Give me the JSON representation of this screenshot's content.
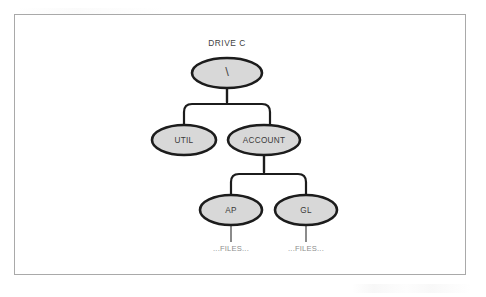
{
  "diagram": {
    "type": "tree",
    "title": "DRIVE C",
    "root": {
      "id": "root",
      "label": "\\",
      "cx": 227,
      "cy": 73,
      "rx": 35,
      "ry": 15
    },
    "nodes": [
      {
        "id": "util",
        "label": "UTIL",
        "cx": 184,
        "cy": 140,
        "rx": 32,
        "ry": 15
      },
      {
        "id": "account",
        "label": "ACCOUNT",
        "cx": 264,
        "cy": 140,
        "rx": 36,
        "ry": 15
      },
      {
        "id": "ap",
        "label": "AP",
        "cx": 231,
        "cy": 210,
        "rx": 31,
        "ry": 15
      },
      {
        "id": "gl",
        "label": "GL",
        "cx": 306,
        "cy": 210,
        "rx": 31,
        "ry": 15
      }
    ],
    "leaves": [
      {
        "id": "ap-files",
        "label": "...FILES...",
        "x": 231,
        "y": 249
      },
      {
        "id": "gl-files",
        "label": "...FILES...",
        "x": 306,
        "y": 249
      }
    ],
    "edges": [
      {
        "from": "root",
        "to": "util"
      },
      {
        "from": "root",
        "to": "account"
      },
      {
        "from": "account",
        "to": "ap"
      },
      {
        "from": "account",
        "to": "gl"
      },
      {
        "from": "ap",
        "to": "ap-files"
      },
      {
        "from": "gl",
        "to": "gl-files"
      }
    ],
    "colors": {
      "node_fill": "#d8d8d8",
      "node_stroke": "#1c1c1c",
      "connector": "#1c1c1c",
      "leaf_text": "#8d8d8d",
      "label_text": "#3a3a3a",
      "page_border": "#a9a9a9",
      "background": "#ffffff"
    }
  }
}
